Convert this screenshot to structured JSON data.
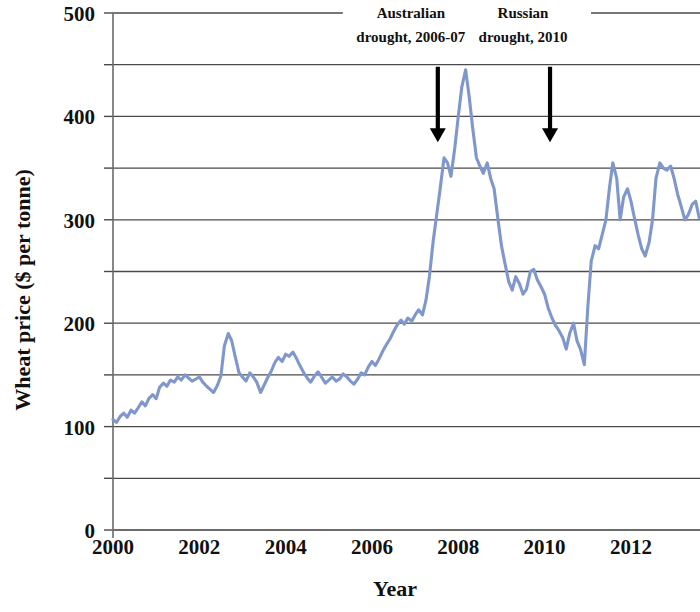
{
  "chart_data": {
    "type": "line",
    "title": "",
    "xlabel": "Year",
    "ylabel": "Wheat price ($ per tonne)",
    "xlim": [
      2000,
      2013.6
    ],
    "ylim": [
      0,
      500
    ],
    "xticks": [
      2000,
      2002,
      2004,
      2006,
      2008,
      2010,
      2012
    ],
    "xtick_labels": [
      "2000",
      "2002",
      "2004",
      "2006",
      "2008",
      "2010",
      "2012"
    ],
    "yticks": [
      0,
      100,
      200,
      300,
      400,
      500
    ],
    "ytick_labels": [
      "0",
      "100",
      "200",
      "300",
      "400",
      "500"
    ],
    "y_gridlines": [
      0,
      50,
      100,
      150,
      200,
      250,
      300,
      350,
      400,
      450,
      500
    ],
    "grid": "horizontal",
    "legend": "none",
    "series": [
      {
        "name": "Wheat price",
        "color": "#7f97cd",
        "x": [
          2000.0,
          2000.08,
          2000.17,
          2000.25,
          2000.33,
          2000.42,
          2000.5,
          2000.58,
          2000.67,
          2000.75,
          2000.83,
          2000.92,
          2001.0,
          2001.08,
          2001.17,
          2001.25,
          2001.33,
          2001.42,
          2001.5,
          2001.58,
          2001.67,
          2001.75,
          2001.83,
          2001.92,
          2002.0,
          2002.08,
          2002.17,
          2002.25,
          2002.33,
          2002.42,
          2002.5,
          2002.58,
          2002.67,
          2002.75,
          2002.83,
          2002.92,
          2003.0,
          2003.08,
          2003.17,
          2003.25,
          2003.33,
          2003.42,
          2003.5,
          2003.58,
          2003.67,
          2003.75,
          2003.83,
          2003.92,
          2004.0,
          2004.08,
          2004.17,
          2004.25,
          2004.33,
          2004.42,
          2004.5,
          2004.58,
          2004.67,
          2004.75,
          2004.83,
          2004.92,
          2005.0,
          2005.08,
          2005.17,
          2005.25,
          2005.33,
          2005.42,
          2005.5,
          2005.58,
          2005.67,
          2005.75,
          2005.83,
          2005.92,
          2006.0,
          2006.08,
          2006.17,
          2006.25,
          2006.33,
          2006.42,
          2006.5,
          2006.58,
          2006.67,
          2006.75,
          2006.83,
          2006.92,
          2007.0,
          2007.08,
          2007.17,
          2007.25,
          2007.33,
          2007.42,
          2007.5,
          2007.58,
          2007.67,
          2007.75,
          2007.83,
          2007.92,
          2008.0,
          2008.08,
          2008.17,
          2008.25,
          2008.33,
          2008.42,
          2008.5,
          2008.58,
          2008.67,
          2008.75,
          2008.83,
          2008.92,
          2009.0,
          2009.08,
          2009.17,
          2009.25,
          2009.33,
          2009.42,
          2009.5,
          2009.58,
          2009.67,
          2009.75,
          2009.83,
          2009.92,
          2010.0,
          2010.08,
          2010.17,
          2010.25,
          2010.33,
          2010.42,
          2010.5,
          2010.58,
          2010.67,
          2010.75,
          2010.83,
          2010.92,
          2011.0,
          2011.08,
          2011.17,
          2011.25,
          2011.33,
          2011.42,
          2011.5,
          2011.58,
          2011.67,
          2011.75,
          2011.83,
          2011.92,
          2012.0,
          2012.08,
          2012.17,
          2012.25,
          2012.33,
          2012.42,
          2012.5,
          2012.58,
          2012.67,
          2012.75,
          2012.83,
          2012.92,
          2013.0,
          2013.08,
          2013.17,
          2013.25,
          2013.33,
          2013.42,
          2013.5,
          2013.58
        ],
        "y": [
          107,
          104,
          110,
          113,
          109,
          116,
          113,
          118,
          124,
          120,
          127,
          131,
          127,
          138,
          142,
          139,
          145,
          143,
          148,
          145,
          150,
          147,
          144,
          146,
          148,
          143,
          139,
          136,
          133,
          140,
          149,
          178,
          190,
          183,
          168,
          152,
          148,
          144,
          152,
          148,
          143,
          133,
          140,
          147,
          154,
          162,
          167,
          163,
          170,
          168,
          172,
          166,
          159,
          152,
          147,
          143,
          149,
          153,
          148,
          142,
          145,
          148,
          144,
          146,
          151,
          148,
          144,
          141,
          146,
          152,
          150,
          158,
          163,
          159,
          166,
          173,
          179,
          185,
          192,
          198,
          203,
          199,
          205,
          202,
          208,
          213,
          208,
          222,
          245,
          280,
          305,
          330,
          360,
          355,
          342,
          370,
          400,
          428,
          445,
          420,
          390,
          360,
          352,
          345,
          355,
          340,
          330,
          300,
          275,
          258,
          240,
          232,
          245,
          238,
          228,
          233,
          250,
          252,
          242,
          235,
          228,
          215,
          205,
          198,
          193,
          186,
          175,
          190,
          200,
          183,
          175,
          160,
          215,
          260,
          275,
          272,
          285,
          300,
          330,
          355,
          340,
          300,
          322,
          330,
          318,
          302,
          285,
          272,
          265,
          278,
          300,
          340,
          355,
          350,
          348,
          352,
          340,
          325,
          312,
          300,
          305,
          315,
          318,
          302
        ]
      }
    ],
    "annotations": [
      {
        "id": "australian-drought",
        "line1": "Australian",
        "line2": "drought, 2006-07",
        "arrow_x": 2006.9,
        "arrow_from_y": 448,
        "arrow_to_y": 375
      },
      {
        "id": "russian-drought",
        "line1": "Russian",
        "line2": "drought, 2010",
        "arrow_x": 2009.5,
        "arrow_from_y": 448,
        "arrow_to_y": 375
      }
    ]
  }
}
